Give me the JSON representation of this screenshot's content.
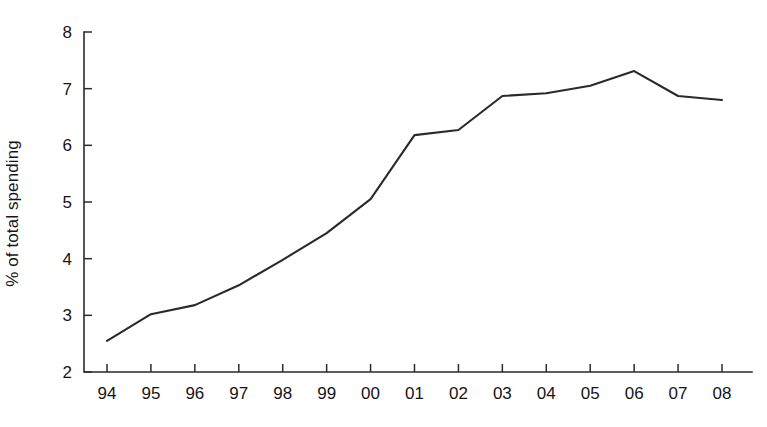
{
  "chart_data": {
    "type": "line",
    "title": "",
    "subtitle": "",
    "xlabel": "",
    "ylabel": "% of total spending",
    "categories": [
      "94",
      "95",
      "96",
      "97",
      "98",
      "99",
      "00",
      "01",
      "02",
      "03",
      "04",
      "05",
      "06",
      "07",
      "08"
    ],
    "values": [
      2.55,
      3.02,
      3.18,
      3.53,
      3.98,
      4.45,
      5.05,
      6.18,
      6.27,
      6.87,
      6.92,
      7.05,
      7.31,
      6.87,
      6.8
    ],
    "series": [
      {
        "name": "% of total spending",
        "values": [
          2.55,
          3.02,
          3.18,
          3.53,
          3.98,
          4.45,
          5.05,
          6.18,
          6.27,
          6.87,
          6.92,
          7.05,
          7.31,
          6.87,
          6.8
        ]
      }
    ],
    "ylim": [
      2,
      8
    ],
    "yticks": [
      2,
      3,
      4,
      5,
      6,
      7,
      8
    ],
    "ytick_labels": [
      "2",
      "3",
      "4",
      "5",
      "6",
      "7",
      "8"
    ],
    "xtick_labels": [
      "94",
      "95",
      "96",
      "97",
      "98",
      "99",
      "00",
      "01",
      "02",
      "03",
      "04",
      "05",
      "06",
      "07",
      "08"
    ],
    "grid": false,
    "legend": false,
    "legend_position": "none",
    "line_color": "#2a2a2a",
    "axis_color": "#2b2b2b",
    "background_color": "#ffffff"
  },
  "axis": {
    "y_title": "% of total spending"
  }
}
